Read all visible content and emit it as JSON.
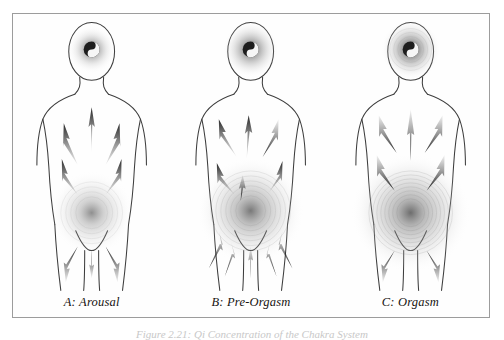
{
  "figure": {
    "caption": "Figure 2.21:  Qi Concentration of the Chakra System",
    "frame_color": "#9c9c9c",
    "background_color": "#ffffff",
    "ink_color": "#2b2b2b"
  },
  "panels": [
    {
      "id": "panel-a",
      "label": "A: Arousal",
      "stage": "Arousal",
      "flow_direction": "upward",
      "head_glow_radius": 17,
      "pelvis_glow_radius": 26,
      "head_glow_opacity": 0.55,
      "pelvis_glow_opacity": 0.45,
      "arrow_count": 9
    },
    {
      "id": "panel-b",
      "label": "B: Pre-Orgasm",
      "stage": "Pre-Orgasm",
      "flow_direction": "bidirectional",
      "head_glow_radius": 20,
      "pelvis_glow_radius": 34,
      "head_glow_opacity": 0.6,
      "pelvis_glow_opacity": 0.55,
      "arrow_count": 11
    },
    {
      "id": "panel-c",
      "label": "C: Orgasm",
      "stage": "Orgasm",
      "flow_direction": "downward",
      "head_glow_radius": 22,
      "pelvis_glow_radius": 40,
      "head_glow_opacity": 0.62,
      "pelvis_glow_opacity": 0.6,
      "arrow_count": 8
    }
  ]
}
